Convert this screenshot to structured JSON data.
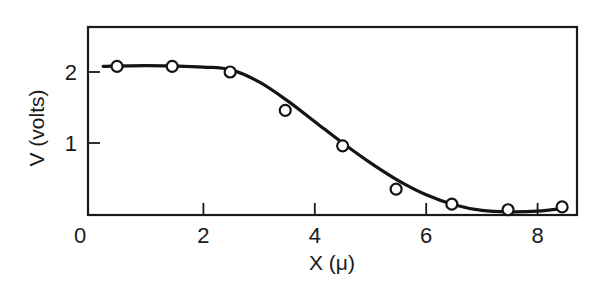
{
  "chart_data": {
    "type": "line",
    "title": "",
    "xlabel": "X (μ)",
    "ylabel": "V (volts)",
    "xlim": [
      0,
      8.72
    ],
    "ylim": [
      0,
      2.63
    ],
    "x_ticks": [
      2,
      4,
      6,
      8
    ],
    "x_tick_labels": [
      "0",
      "2",
      "4",
      "6",
      "8"
    ],
    "y_ticks": [
      1,
      2
    ],
    "y_tick_labels": [
      "1",
      "2"
    ],
    "grid": false,
    "legend": null,
    "series": [
      {
        "name": "measured",
        "style": "open-circle markers",
        "x": [
          0.45,
          1.44,
          2.48,
          3.47,
          4.5,
          5.46,
          6.46,
          7.47,
          8.44
        ],
        "y": [
          2.08,
          2.08,
          2.0,
          1.46,
          0.96,
          0.35,
          0.14,
          0.06,
          0.1
        ]
      },
      {
        "name": "fitted curve",
        "style": "solid line",
        "x": [
          0.2,
          1.0,
          2.0,
          2.5,
          3.0,
          3.5,
          4.0,
          4.5,
          5.0,
          5.5,
          6.0,
          6.5,
          7.0,
          7.5,
          8.0,
          8.5
        ],
        "y": [
          2.08,
          2.09,
          2.07,
          2.03,
          1.86,
          1.6,
          1.3,
          1.0,
          0.72,
          0.47,
          0.27,
          0.13,
          0.05,
          0.03,
          0.04,
          0.08
        ]
      }
    ]
  },
  "layout": {
    "plot_left_px": 92,
    "plot_right_px": 577,
    "frame_left_px": 88,
    "plot_top_px": 27,
    "plot_bottom_px": 214,
    "px_per_x": 55.7,
    "px_per_y": 71
  }
}
